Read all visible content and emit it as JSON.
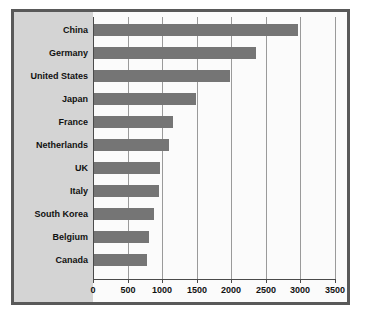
{
  "chart_data": {
    "type": "bar",
    "orientation": "horizontal",
    "title": "",
    "xlabel": "",
    "ylabel": "",
    "categories": [
      "China",
      "Germany",
      "United States",
      "Japan",
      "France",
      "Netherlands",
      "UK",
      "Italy",
      "South Korea",
      "Belgium",
      "Canada"
    ],
    "values": [
      2950,
      2340,
      1970,
      1470,
      1140,
      1090,
      960,
      940,
      870,
      800,
      770
    ],
    "xlim": [
      0,
      3500
    ],
    "xticks": [
      0,
      500,
      1000,
      1500,
      2000,
      2500,
      3000,
      3500
    ],
    "xtick_labels": [
      "0",
      "500",
      "1000",
      "1500",
      "2000",
      "2500",
      "3000",
      "3500"
    ],
    "grid": true,
    "grid_axis": "x",
    "legend": null,
    "colors": {
      "bar": "#757575",
      "plot_background": "#fbfbfb",
      "panel_background": "#d4d4d4",
      "frame_border": "#595959",
      "gridline": "#9a9a9a",
      "axis": "#4a4a4a",
      "text": "#111111"
    }
  }
}
